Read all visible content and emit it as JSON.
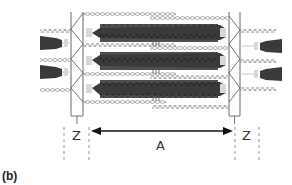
{
  "figure": {
    "panel_label": "(b)",
    "labels": {
      "z_left": "Z",
      "z_right": "Z",
      "a_band": "A"
    },
    "colors": {
      "thick_filament": "#3a3a3a",
      "thin_filament": "#9a9a9a",
      "z_line": "#666666",
      "arrow": "#111111",
      "dashed_guide": "#888888",
      "text": "#333333"
    },
    "thick_filament_rows_y": [
      33,
      60,
      88
    ],
    "thin_filament_rows_y": [
      14,
      46,
      74,
      103
    ],
    "partial_thick_left_y": [
      43,
      72
    ],
    "partial_thick_right_y": [
      46,
      74
    ]
  }
}
